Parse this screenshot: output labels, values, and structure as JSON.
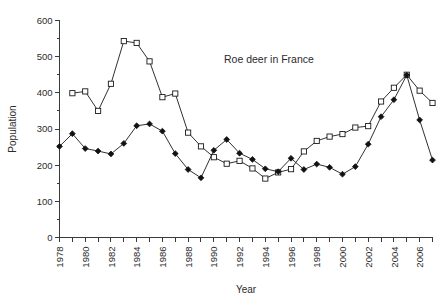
{
  "chart_data": {
    "type": "line",
    "title": "Roe deer in France",
    "xlabel": "Year",
    "ylabel": "Population",
    "xlim": [
      1978,
      2007
    ],
    "ylim": [
      0,
      600
    ],
    "ytick_step": 100,
    "ytick_minor_step": 50,
    "xtick_step": 1,
    "xtick_label_step": 2,
    "grid": false,
    "legend": "none",
    "yticks": [
      0,
      100,
      200,
      300,
      400,
      500,
      600
    ],
    "xtick_labels": [
      "1978",
      "1980",
      "1982",
      "1984",
      "1986",
      "1988",
      "1990",
      "1992",
      "1994",
      "1996",
      "1998",
      "2000",
      "2002",
      "2004",
      "2006"
    ],
    "series": [
      {
        "name": "open-square-series",
        "marker": "open-square",
        "x": [
          1979,
          1980,
          1981,
          1982,
          1983,
          1984,
          1985,
          1986,
          1987,
          1988,
          1989,
          1990,
          1991,
          1992,
          1993,
          1994,
          1995,
          1996,
          1997,
          1998,
          1999,
          2000,
          2001,
          2002,
          2003,
          2004,
          2005,
          2006,
          2007
        ],
        "values": [
          399,
          404,
          350,
          425,
          543,
          538,
          487,
          388,
          398,
          290,
          252,
          222,
          204,
          212,
          191,
          163,
          180,
          189,
          238,
          267,
          279,
          286,
          304,
          308,
          376,
          414,
          450,
          406,
          372
        ]
      },
      {
        "name": "filled-diamond-series",
        "marker": "filled-diamond",
        "x": [
          1978,
          1979,
          1980,
          1981,
          1982,
          1983,
          1984,
          1985,
          1986,
          1987,
          1988,
          1989,
          1990,
          1991,
          1992,
          1993,
          1994,
          1995,
          1996,
          1997,
          1998,
          1999,
          2000,
          2001,
          2002,
          2003,
          2004,
          2005,
          2006,
          2007
        ],
        "values": [
          252,
          287,
          246,
          239,
          231,
          260,
          309,
          314,
          294,
          232,
          188,
          165,
          241,
          271,
          233,
          216,
          190,
          182,
          219,
          188,
          203,
          194,
          175,
          196,
          258,
          334,
          381,
          449,
          325,
          214
        ]
      }
    ]
  }
}
